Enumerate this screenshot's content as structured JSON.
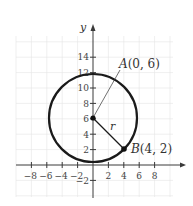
{
  "figure": {
    "type": "circle-on-coordinate-plane",
    "axis_x_label": "",
    "axis_y_label": "y",
    "x_ticks": [
      -8,
      -6,
      -4,
      -2,
      2,
      4,
      6,
      8
    ],
    "x_tick_labels": [
      "−8",
      "−6",
      "−4",
      "−2",
      "2",
      "4",
      "6",
      "8"
    ],
    "y_ticks": [
      -2,
      2,
      4,
      6,
      8,
      10,
      12,
      14
    ],
    "y_tick_labels": [
      "−2",
      "2",
      "4",
      "6",
      "8",
      "10",
      "12",
      "14"
    ],
    "center": {
      "name": "A",
      "x": 0,
      "y": 6,
      "label": "A(0, 6)",
      "label_letter": "A",
      "label_coords": "(0, 6)"
    },
    "point_on_circle": {
      "name": "B",
      "x": 4,
      "y": 2,
      "label": "B(4, 2)",
      "label_letter": "B",
      "label_coords": "(4, 2)"
    },
    "radius_label": "r",
    "colors": {
      "stroke": "#1a1a1a",
      "grid": "#e4e4e4",
      "text": "#333333"
    }
  }
}
